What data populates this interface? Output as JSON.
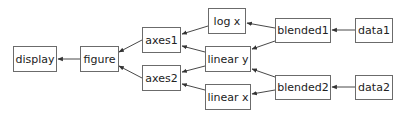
{
  "diagram": {
    "type": "directed-graph",
    "direction": "right-to-left",
    "colors": {
      "box_border": "#6b6b6b",
      "edge": "#333333",
      "text": "#222222",
      "background": "#ffffff"
    },
    "nodes": [
      {
        "id": "display",
        "label": "display",
        "x": 13,
        "y": 46,
        "w": 44,
        "h": 26
      },
      {
        "id": "figure",
        "label": "figure",
        "x": 80,
        "y": 46,
        "w": 39,
        "h": 26
      },
      {
        "id": "axes1",
        "label": "axes1",
        "x": 142,
        "y": 27,
        "w": 39,
        "h": 26
      },
      {
        "id": "axes2",
        "label": "axes2",
        "x": 142,
        "y": 65,
        "w": 39,
        "h": 26
      },
      {
        "id": "logx",
        "label": "log x",
        "x": 208,
        "y": 8,
        "w": 38,
        "h": 26
      },
      {
        "id": "lineary",
        "label": "linear y",
        "x": 205,
        "y": 46,
        "w": 46,
        "h": 26
      },
      {
        "id": "linearx",
        "label": "linear x",
        "x": 205,
        "y": 84,
        "w": 46,
        "h": 26
      },
      {
        "id": "blended1",
        "label": "blended1",
        "x": 275,
        "y": 18,
        "w": 56,
        "h": 25
      },
      {
        "id": "blended2",
        "label": "blended2",
        "x": 275,
        "y": 75,
        "w": 56,
        "h": 25
      },
      {
        "id": "data1",
        "label": "data1",
        "x": 355,
        "y": 18,
        "w": 38,
        "h": 25
      },
      {
        "id": "data2",
        "label": "data2",
        "x": 355,
        "y": 75,
        "w": 38,
        "h": 25
      }
    ],
    "edges": [
      {
        "from": "figure",
        "to": "display",
        "x1": 80,
        "y1": 59,
        "x2": 58,
        "y2": 59
      },
      {
        "from": "axes1",
        "to": "figure",
        "x1": 142,
        "y1": 40,
        "x2": 119,
        "y2": 52
      },
      {
        "from": "axes2",
        "to": "figure",
        "x1": 142,
        "y1": 78,
        "x2": 119,
        "y2": 66
      },
      {
        "from": "logx",
        "to": "axes1",
        "x1": 208,
        "y1": 26,
        "x2": 182,
        "y2": 34
      },
      {
        "from": "lineary",
        "to": "axes1",
        "x1": 205,
        "y1": 52,
        "x2": 182,
        "y2": 46
      },
      {
        "from": "lineary",
        "to": "axes2",
        "x1": 205,
        "y1": 66,
        "x2": 182,
        "y2": 72
      },
      {
        "from": "linearx",
        "to": "axes2",
        "x1": 205,
        "y1": 90,
        "x2": 182,
        "y2": 84
      },
      {
        "from": "blended1",
        "to": "logx",
        "x1": 275,
        "y1": 28,
        "x2": 247,
        "y2": 23
      },
      {
        "from": "blended1",
        "to": "lineary",
        "x1": 275,
        "y1": 41,
        "x2": 252,
        "y2": 49
      },
      {
        "from": "blended2",
        "to": "lineary",
        "x1": 275,
        "y1": 77,
        "x2": 252,
        "y2": 69
      },
      {
        "from": "blended2",
        "to": "linearx",
        "x1": 275,
        "y1": 90,
        "x2": 252,
        "y2": 94
      },
      {
        "from": "data1",
        "to": "blended1",
        "x1": 355,
        "y1": 30,
        "x2": 332,
        "y2": 30
      },
      {
        "from": "data2",
        "to": "blended2",
        "x1": 355,
        "y1": 87,
        "x2": 332,
        "y2": 87
      }
    ]
  }
}
